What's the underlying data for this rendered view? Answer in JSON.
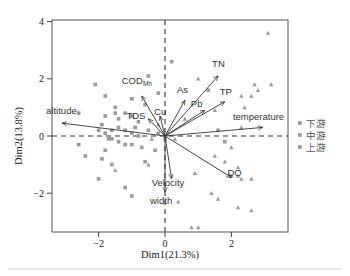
{
  "chart_data": {
    "type": "scatter",
    "subtype": "pca_biplot",
    "title": "",
    "xlabel": "Dim1(21.3%)",
    "ylabel": "Dim2(13.8%)",
    "xlim": [
      -3.4,
      3.7
    ],
    "ylim": [
      -3.4,
      4.0
    ],
    "xticks": [
      -2,
      0,
      2
    ],
    "yticks": [
      -2,
      0,
      2,
      4
    ],
    "grid": false,
    "reference_lines": {
      "x": 0,
      "y": 0,
      "style": "dashed"
    },
    "legend": {
      "position": "right",
      "entries": [
        "下游",
        "中游",
        "上游"
      ]
    },
    "vectors": [
      {
        "name": "TN",
        "x": 1.6,
        "y": 2.1
      },
      {
        "name": "TP",
        "x": 1.8,
        "y": 1.2
      },
      {
        "name": "Pb",
        "x": 1.2,
        "y": 0.9
      },
      {
        "name": "As",
        "x": 0.6,
        "y": 1.25
      },
      {
        "name": "COD_Mn",
        "x": -0.7,
        "y": 1.4
      },
      {
        "name": "TDS",
        "x": -0.5,
        "y": 0.6
      },
      {
        "name": "Cu",
        "x": -0.15,
        "y": 0.7
      },
      {
        "name": "altitude",
        "x": -3.1,
        "y": 0.45
      },
      {
        "name": "temperature",
        "x": 2.95,
        "y": 0.3
      },
      {
        "name": "DO",
        "x": 2.0,
        "y": -1.45
      },
      {
        "name": "Velocity",
        "x": 0.2,
        "y": -1.5
      },
      {
        "name": "width",
        "x": 0.0,
        "y": -1.95
      }
    ],
    "series": [
      {
        "name": "下游",
        "marker": "square",
        "points": [
          [
            -0.5,
            2.1
          ],
          [
            0.2,
            2.6
          ],
          [
            -0.2,
            1.5
          ],
          [
            -1.0,
            1.3
          ],
          [
            -0.6,
            1.1
          ],
          [
            1.3,
            1.6
          ],
          [
            1.6,
            0.2
          ],
          [
            1.8,
            -0.2
          ]
        ]
      },
      {
        "name": "中游",
        "marker": "triangle",
        "points": [
          [
            1.0,
            2.0
          ],
          [
            2.7,
            1.8
          ],
          [
            2.8,
            1.6
          ],
          [
            2.6,
            1.4
          ],
          [
            3.2,
            1.8
          ],
          [
            3.1,
            3.6
          ],
          [
            2.3,
            1.4
          ],
          [
            2.4,
            1.0
          ],
          [
            1.5,
            0.9
          ],
          [
            2.3,
            0.3
          ],
          [
            2.0,
            -0.4
          ],
          [
            2.3,
            -1.5
          ],
          [
            2.2,
            -1.1
          ],
          [
            2.6,
            -1.5
          ],
          [
            1.5,
            -0.7
          ],
          [
            1.8,
            -0.9
          ],
          [
            0.9,
            -1.3
          ],
          [
            2.0,
            -1.4
          ],
          [
            2.2,
            -1.4
          ],
          [
            1.4,
            -2.0
          ],
          [
            1.6,
            -2.2
          ],
          [
            2.2,
            -2.5
          ],
          [
            2.6,
            -2.6
          ],
          [
            1.0,
            -3.2
          ],
          [
            0.8,
            -3.2
          ],
          [
            0.4,
            -2.3
          ],
          [
            -0.5,
            -1.0
          ],
          [
            -1.5,
            -1.2
          ],
          [
            -0.4,
            -0.1
          ],
          [
            0.3,
            -0.1
          ],
          [
            -0.2,
            0.4
          ],
          [
            0.6,
            0.6
          ]
        ]
      },
      {
        "name": "上游",
        "marker": "square",
        "points": [
          [
            -2.1,
            1.8
          ],
          [
            -1.8,
            1.4
          ],
          [
            -2.6,
            0.8
          ],
          [
            -1.8,
            0.7
          ],
          [
            -1.5,
            0.8
          ],
          [
            -1.4,
            0.6
          ],
          [
            -1.2,
            0.8
          ],
          [
            -1.0,
            0.7
          ],
          [
            -1.9,
            0.4
          ],
          [
            -2.0,
            0.2
          ],
          [
            -1.8,
            0.1
          ],
          [
            -1.6,
            0.2
          ],
          [
            -1.4,
            0.3
          ],
          [
            -1.2,
            0.2
          ],
          [
            -1.0,
            0.1
          ],
          [
            -0.8,
            0.0
          ],
          [
            -1.6,
            -0.1
          ],
          [
            -1.4,
            -0.2
          ],
          [
            -1.2,
            -0.3
          ],
          [
            -1.0,
            -0.3
          ],
          [
            -0.7,
            -0.4
          ],
          [
            -1.8,
            -0.5
          ],
          [
            -1.9,
            -0.8
          ],
          [
            -1.6,
            -1.0
          ],
          [
            -2.6,
            -0.3
          ],
          [
            -2.4,
            -0.7
          ],
          [
            -2.0,
            -1.5
          ],
          [
            -1.2,
            -1.8
          ],
          [
            -1.0,
            -2.1
          ],
          [
            -0.6,
            -0.9
          ],
          [
            -0.3,
            -0.5
          ],
          [
            -0.2,
            0.1
          ],
          [
            0.0,
            -0.1
          ],
          [
            -1.5,
            1.0
          ],
          [
            -0.9,
            0.3
          ],
          [
            -0.5,
            0.2
          ],
          [
            -1.7,
            -0.1
          ],
          [
            -0.8,
            0.5
          ]
        ]
      }
    ],
    "colors": {
      "points": "#9a9a9a",
      "vectors": "#333333",
      "axes": "#444444",
      "text": "#222222"
    }
  }
}
